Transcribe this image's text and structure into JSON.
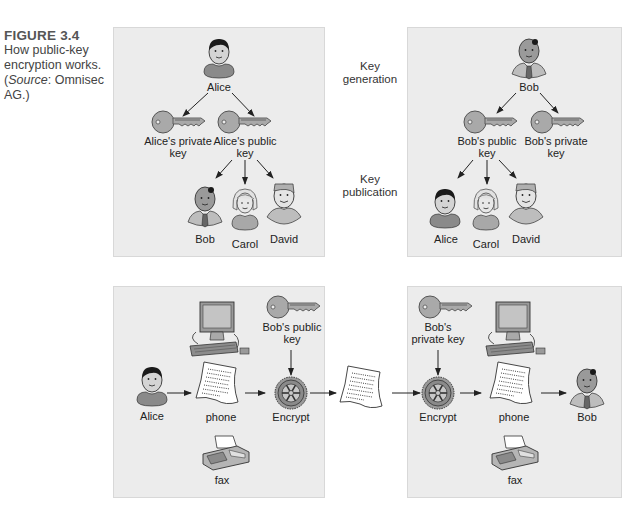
{
  "caption": {
    "figure_label": "FIGURE 3.4",
    "text_before": "How public-key encryption works. (",
    "source_word": "Source",
    "text_after": ": Omnisec AG.)"
  },
  "stages": {
    "key_generation": "Key generation",
    "key_publication": "Key publication"
  },
  "panel_alice_keys": {
    "owner": "Alice",
    "private_key": "Alice's private key",
    "public_key": "Alice's public key",
    "recipients": [
      "Bob",
      "Carol",
      "David"
    ]
  },
  "panel_bob_keys": {
    "owner": "Bob",
    "public_key": "Bob's public key",
    "private_key": "Bob's private key",
    "recipients": [
      "Alice",
      "Carol",
      "David"
    ]
  },
  "panel_send": {
    "sender": "Alice",
    "channel": "phone",
    "alt_channel": "fax",
    "key": "Bob's public key",
    "operation": "Encrypt"
  },
  "panel_receive": {
    "key": "Bob's private key",
    "operation": "Encrypt",
    "channel": "phone",
    "alt_channel": "fax",
    "receiver": "Bob"
  },
  "colors": {
    "panel_bg": "#ececec",
    "key_fill": "#a9a9a9",
    "skin": "#d4d4d4",
    "shirt": "#8a8a8a",
    "hair": "#1a1a1a"
  }
}
